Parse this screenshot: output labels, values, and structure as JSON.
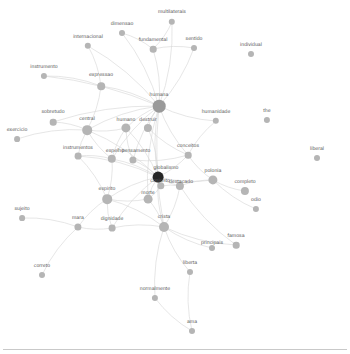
{
  "figure": {
    "kind": "force-directed-word-network",
    "background_color": "#ffffff",
    "node_color": "#b5b5b5",
    "node_color_hub": "#9a9a9a",
    "node_color_dark": "#262626",
    "edge_color": "#d8d8d8",
    "label_color": "#5a5a5a",
    "width": 350,
    "height": 354
  },
  "chart_data": {
    "type": "network",
    "title": "",
    "nodes": [
      {
        "id": "multilaterais",
        "label": "multilaterais",
        "x": 172,
        "y": 22,
        "r": 3.2,
        "shade": "light",
        "lx": 172,
        "ly": 10
      },
      {
        "id": "dimensao",
        "label": "dimensao",
        "x": 122,
        "y": 33,
        "r": 3.0,
        "shade": "light",
        "lx": 122,
        "ly": 22
      },
      {
        "id": "fundamental",
        "label": "fundamental",
        "x": 153,
        "y": 49,
        "r": 3.3,
        "shade": "light",
        "lx": 153,
        "ly": 38
      },
      {
        "id": "sentido",
        "label": "sentido",
        "x": 194,
        "y": 48,
        "r": 3.0,
        "shade": "light",
        "lx": 194,
        "ly": 37
      },
      {
        "id": "internacional",
        "label": "internacional",
        "x": 88,
        "y": 46,
        "r": 3.2,
        "shade": "light",
        "lx": 88,
        "ly": 35
      },
      {
        "id": "individual",
        "label": "individual",
        "x": 251,
        "y": 54,
        "r": 3.0,
        "shade": "light",
        "lx": 251,
        "ly": 43
      },
      {
        "id": "instrumento",
        "label": "instrumento",
        "x": 44,
        "y": 76,
        "r": 3.1,
        "shade": "light",
        "lx": 44,
        "ly": 65
      },
      {
        "id": "expressao",
        "label": "expressao",
        "x": 101,
        "y": 86,
        "r": 3.8,
        "shade": "light",
        "lx": 101,
        "ly": 73
      },
      {
        "id": "humana",
        "label": "humana",
        "x": 159,
        "y": 106,
        "r": 6.3,
        "shade": "hub",
        "lx": 159,
        "ly": 93
      },
      {
        "id": "humanidade",
        "label": "humanidade",
        "x": 216,
        "y": 121,
        "r": 3.2,
        "shade": "light",
        "lx": 216,
        "ly": 110
      },
      {
        "id": "the",
        "label": "the",
        "x": 267,
        "y": 120,
        "r": 3.1,
        "shade": "light",
        "lx": 267,
        "ly": 109
      },
      {
        "id": "sobretudo",
        "label": "sobretudo",
        "x": 53,
        "y": 122,
        "r": 3.3,
        "shade": "light",
        "lx": 53,
        "ly": 110
      },
      {
        "id": "central",
        "label": "central",
        "x": 87,
        "y": 130,
        "r": 4.8,
        "shade": "light",
        "lx": 87,
        "ly": 117
      },
      {
        "id": "humano",
        "label": "humano",
        "x": 126,
        "y": 128,
        "r": 4.6,
        "shade": "light",
        "lx": 126,
        "ly": 118
      },
      {
        "id": "destruir",
        "label": "destruir",
        "x": 148,
        "y": 128,
        "r": 4.1,
        "shade": "light",
        "lx": 148,
        "ly": 118
      },
      {
        "id": "exercicio",
        "label": "exercicio",
        "x": 17,
        "y": 139,
        "r": 2.9,
        "shade": "light",
        "lx": 17,
        "ly": 128
      },
      {
        "id": "liberal",
        "label": "liberal",
        "x": 317,
        "y": 158,
        "r": 3.0,
        "shade": "light",
        "lx": 317,
        "ly": 147
      },
      {
        "id": "conceitos",
        "label": "conceitos",
        "x": 188,
        "y": 155,
        "r": 3.3,
        "shade": "light",
        "lx": 188,
        "ly": 144
      },
      {
        "id": "instrumentos",
        "label": "instrumentos",
        "x": 78,
        "y": 156,
        "r": 3.4,
        "shade": "light",
        "lx": 78,
        "ly": 146
      },
      {
        "id": "espelho",
        "label": "espelho",
        "x": 112,
        "y": 159,
        "r": 4.2,
        "shade": "light",
        "lx": 115,
        "ly": 149
      },
      {
        "id": "pensamento",
        "label": "pensamento",
        "x": 133,
        "y": 160,
        "r": 3.6,
        "shade": "light",
        "lx": 136,
        "ly": 149
      },
      {
        "id": "globalismo",
        "label": "globalismo",
        "x": 158,
        "y": 177,
        "r": 5.4,
        "shade": "dark",
        "lx": 166,
        "ly": 166
      },
      {
        "id": "polonia",
        "label": "polonia",
        "x": 213,
        "y": 180,
        "r": 4.6,
        "shade": "light",
        "lx": 213,
        "ly": 169
      },
      {
        "id": "completo",
        "label": "completo",
        "x": 245,
        "y": 191,
        "r": 4.1,
        "shade": "light",
        "lx": 245,
        "ly": 180
      },
      {
        "id": "conjunto",
        "label": "conjunto",
        "x": 161,
        "y": 186,
        "r": 3.7,
        "shade": "light",
        "lx": 160,
        "ly": 179
      },
      {
        "id": "destacado",
        "label": "destacado",
        "x": 180,
        "y": 186,
        "r": 4.1,
        "shade": "light",
        "lx": 181,
        "ly": 180
      },
      {
        "id": "espirito",
        "label": "espirito",
        "x": 107,
        "y": 199,
        "r": 4.8,
        "shade": "light",
        "lx": 107,
        "ly": 187
      },
      {
        "id": "morte",
        "label": "morte",
        "x": 148,
        "y": 199,
        "r": 4.4,
        "shade": "light",
        "lx": 148,
        "ly": 191
      },
      {
        "id": "odio",
        "label": "odio",
        "x": 256,
        "y": 209,
        "r": 3.1,
        "shade": "light",
        "lx": 256,
        "ly": 198
      },
      {
        "id": "sujeito",
        "label": "sujeito",
        "x": 22,
        "y": 218,
        "r": 2.9,
        "shade": "light",
        "lx": 22,
        "ly": 207
      },
      {
        "id": "mara",
        "label": "mara",
        "x": 78,
        "y": 227,
        "r": 3.6,
        "shade": "light",
        "lx": 78,
        "ly": 216
      },
      {
        "id": "dignidade",
        "label": "dignidade",
        "x": 112,
        "y": 228,
        "r": 3.4,
        "shade": "light",
        "lx": 112,
        "ly": 217
      },
      {
        "id": "crista",
        "label": "crista",
        "x": 164,
        "y": 227,
        "r": 5.0,
        "shade": "light",
        "lx": 164,
        "ly": 215
      },
      {
        "id": "famosa",
        "label": "famosa",
        "x": 236,
        "y": 245,
        "r": 3.3,
        "shade": "light",
        "lx": 236,
        "ly": 234
      },
      {
        "id": "principais",
        "label": "principais",
        "x": 212,
        "y": 248,
        "r": 3.0,
        "shade": "light",
        "lx": 212,
        "ly": 241
      },
      {
        "id": "liberta",
        "label": "liberta",
        "x": 190,
        "y": 272,
        "r": 3.0,
        "shade": "light",
        "lx": 190,
        "ly": 261
      },
      {
        "id": "correto",
        "label": "correto",
        "x": 42,
        "y": 275,
        "r": 3.0,
        "shade": "light",
        "lx": 42,
        "ly": 264
      },
      {
        "id": "normalmente",
        "label": "normalmente",
        "x": 155,
        "y": 298,
        "r": 3.1,
        "shade": "light",
        "lx": 155,
        "ly": 287
      },
      {
        "id": "ama",
        "label": "ama",
        "x": 192,
        "y": 331,
        "r": 3.0,
        "shade": "light",
        "lx": 192,
        "ly": 320
      }
    ],
    "edges": [
      [
        "humana",
        "multilaterais"
      ],
      [
        "humana",
        "dimensao"
      ],
      [
        "humana",
        "fundamental"
      ],
      [
        "humana",
        "sentido"
      ],
      [
        "humana",
        "internacional"
      ],
      [
        "humana",
        "expressao"
      ],
      [
        "humana",
        "instrumento"
      ],
      [
        "humana",
        "humano"
      ],
      [
        "humana",
        "destruir"
      ],
      [
        "humana",
        "central"
      ],
      [
        "humana",
        "espelho"
      ],
      [
        "humana",
        "pensamento"
      ],
      [
        "humana",
        "globalismo"
      ],
      [
        "humana",
        "conceitos"
      ],
      [
        "humana",
        "humanidade"
      ],
      [
        "humana",
        "sobretudo"
      ],
      [
        "humana",
        "crista"
      ],
      [
        "humana",
        "morte"
      ],
      [
        "globalismo",
        "conjunto"
      ],
      [
        "globalismo",
        "destacado"
      ],
      [
        "globalismo",
        "polonia"
      ],
      [
        "globalismo",
        "morte"
      ],
      [
        "globalismo",
        "crista"
      ],
      [
        "globalismo",
        "espirito"
      ],
      [
        "globalismo",
        "pensamento"
      ],
      [
        "globalismo",
        "espelho"
      ],
      [
        "globalismo",
        "conceitos"
      ],
      [
        "globalismo",
        "instrumentos"
      ],
      [
        "globalismo",
        "central"
      ],
      [
        "globalismo",
        "dignidade"
      ],
      [
        "globalismo",
        "humano"
      ],
      [
        "globalismo",
        "destruir"
      ],
      [
        "polonia",
        "completo"
      ],
      [
        "polonia",
        "odio"
      ],
      [
        "polonia",
        "destacado"
      ],
      [
        "crista",
        "liberta"
      ],
      [
        "crista",
        "normalmente"
      ],
      [
        "crista",
        "principais"
      ],
      [
        "crista",
        "famosa"
      ],
      [
        "crista",
        "dignidade"
      ],
      [
        "crista",
        "morte"
      ],
      [
        "crista",
        "espirito"
      ],
      [
        "crista",
        "destacado"
      ],
      [
        "normalmente",
        "ama"
      ],
      [
        "liberta",
        "ama"
      ],
      [
        "central",
        "instrumentos"
      ],
      [
        "central",
        "sobretudo"
      ],
      [
        "central",
        "exercicio"
      ],
      [
        "central",
        "espelho"
      ],
      [
        "central",
        "humano"
      ],
      [
        "central",
        "expressao"
      ],
      [
        "espirito",
        "mara"
      ],
      [
        "espirito",
        "espelho"
      ],
      [
        "espirito",
        "instrumentos"
      ],
      [
        "espirito",
        "dignidade"
      ],
      [
        "espirito",
        "morte"
      ],
      [
        "mara",
        "correto"
      ],
      [
        "mara",
        "sujeito"
      ],
      [
        "mara",
        "dignidade"
      ],
      [
        "expressao",
        "internacional"
      ],
      [
        "expressao",
        "instrumento"
      ],
      [
        "fundamental",
        "dimensao"
      ],
      [
        "fundamental",
        "multilaterais"
      ],
      [
        "destruir",
        "conceitos"
      ],
      [
        "humano",
        "espelho"
      ],
      [
        "humano",
        "pensamento"
      ],
      [
        "pensamento",
        "conceitos"
      ],
      [
        "conceitos",
        "polonia"
      ],
      [
        "destacado",
        "famosa"
      ],
      [
        "destacado",
        "conjunto"
      ],
      [
        "morte",
        "conjunto"
      ],
      [
        "espelho",
        "instrumentos"
      ],
      [
        "sentido",
        "fundamental"
      ],
      [
        "humanidade",
        "conceitos"
      ]
    ]
  }
}
